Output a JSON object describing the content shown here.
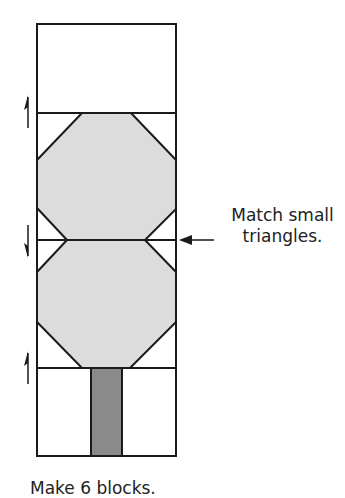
{
  "callout": {
    "line1": "Match small",
    "line2": "triangles."
  },
  "caption": "Make 6 blocks.",
  "colors": {
    "outline": "#1a1a1a",
    "foliage_fill": "#dcdcdc",
    "trunk_fill": "#8a8a8a",
    "background": "#ffffff"
  },
  "pressing_arrows": [
    {
      "row": "top-seam",
      "direction": "up"
    },
    {
      "row": "middle-seam",
      "direction": "down"
    },
    {
      "row": "bottom-seam",
      "direction": "up"
    }
  ]
}
